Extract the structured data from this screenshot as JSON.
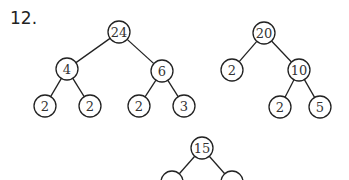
{
  "problem_label": "12.",
  "trees": [
    {
      "name": "tree-24",
      "nodes": [
        {
          "id": "a",
          "value": "24",
          "x": 119,
          "y": 32
        },
        {
          "id": "b",
          "value": "4",
          "x": 67,
          "y": 69
        },
        {
          "id": "c",
          "value": "6",
          "x": 162,
          "y": 71
        },
        {
          "id": "d",
          "value": "2",
          "x": 45,
          "y": 106
        },
        {
          "id": "e",
          "value": "2",
          "x": 90,
          "y": 106
        },
        {
          "id": "f",
          "value": "2",
          "x": 139,
          "y": 106
        },
        {
          "id": "g",
          "value": "3",
          "x": 184,
          "y": 106
        }
      ],
      "edges": [
        [
          "a",
          "b"
        ],
        [
          "a",
          "c"
        ],
        [
          "b",
          "d"
        ],
        [
          "b",
          "e"
        ],
        [
          "c",
          "f"
        ],
        [
          "c",
          "g"
        ]
      ]
    },
    {
      "name": "tree-20",
      "nodes": [
        {
          "id": "a",
          "value": "20",
          "x": 264,
          "y": 33
        },
        {
          "id": "b",
          "value": "2",
          "x": 232,
          "y": 70
        },
        {
          "id": "c",
          "value": "10",
          "x": 299,
          "y": 70
        },
        {
          "id": "d",
          "value": "2",
          "x": 280,
          "y": 107
        },
        {
          "id": "e",
          "value": "5",
          "x": 320,
          "y": 107
        }
      ],
      "edges": [
        [
          "a",
          "b"
        ],
        [
          "a",
          "c"
        ],
        [
          "c",
          "d"
        ],
        [
          "c",
          "e"
        ]
      ]
    },
    {
      "name": "tree-15",
      "nodes": [
        {
          "id": "a",
          "value": "15",
          "x": 202,
          "y": 148
        },
        {
          "id": "b",
          "value": "",
          "x": 172,
          "y": 182
        },
        {
          "id": "c",
          "value": "",
          "x": 232,
          "y": 182
        }
      ],
      "edges": [
        [
          "a",
          "b"
        ],
        [
          "a",
          "c"
        ]
      ]
    }
  ],
  "node_radius": 11
}
